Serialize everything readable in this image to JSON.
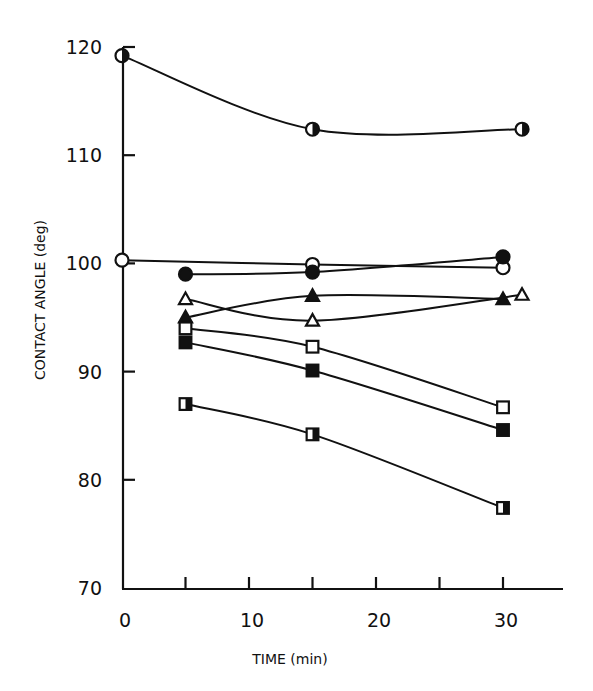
{
  "chart_data": {
    "type": "line",
    "title": "",
    "xlabel": "TIME (min)",
    "ylabel": "CONTACT ANGLE (deg)",
    "xlim": [
      0,
      35
    ],
    "ylim": [
      70,
      120
    ],
    "xticks": [
      0,
      10,
      20,
      30
    ],
    "xminor_ticks": [
      5,
      15,
      25
    ],
    "yticks": [
      70,
      80,
      90,
      100,
      110,
      120
    ],
    "grid": false,
    "legend": "none",
    "series": [
      {
        "name": "half-filled circle",
        "marker": "circle-half",
        "x": [
          0,
          15,
          31.5
        ],
        "y": [
          119.2,
          112.4,
          112.4
        ]
      },
      {
        "name": "open circle",
        "marker": "circle-open",
        "x": [
          0,
          15,
          30
        ],
        "y": [
          100.3,
          99.9,
          99.6
        ]
      },
      {
        "name": "filled circle",
        "marker": "circle-filled",
        "x": [
          5,
          15,
          30
        ],
        "y": [
          99.0,
          99.2,
          100.6
        ]
      },
      {
        "name": "open triangle",
        "marker": "triangle-open",
        "x": [
          5,
          15,
          31.5
        ],
        "y": [
          96.7,
          94.7,
          97.1
        ]
      },
      {
        "name": "filled triangle",
        "marker": "triangle-filled",
        "x": [
          5,
          15,
          30
        ],
        "y": [
          95.0,
          97.0,
          96.7
        ]
      },
      {
        "name": "open square",
        "marker": "square-open",
        "x": [
          5,
          15,
          30
        ],
        "y": [
          94.0,
          92.3,
          86.7
        ]
      },
      {
        "name": "filled square",
        "marker": "square-filled",
        "x": [
          5,
          15,
          30
        ],
        "y": [
          92.7,
          90.1,
          84.6
        ]
      },
      {
        "name": "half-filled square",
        "marker": "square-half",
        "x": [
          5,
          15,
          30
        ],
        "y": [
          87.0,
          84.2,
          77.4
        ]
      }
    ]
  }
}
